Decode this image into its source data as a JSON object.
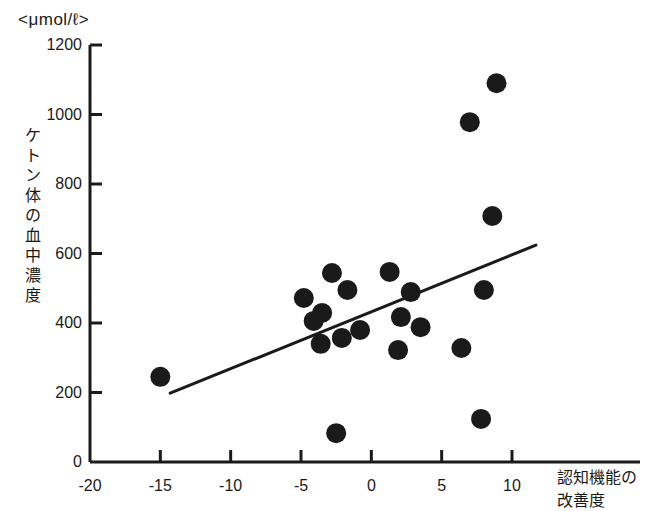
{
  "figure": {
    "unit_label": "<μmol/ℓ>",
    "y_axis_title": "ケトン体の血中濃度",
    "x_axis_title_line1": "認知機能の",
    "x_axis_title_line2": "改善度",
    "marker_color": "#1a1a1a",
    "axis_color": "#1a1a1a",
    "trendline_color": "#1a1a1a",
    "background_color": "#ffffff"
  },
  "chart_data": {
    "type": "scatter",
    "title": "",
    "subtitle": "",
    "xlabel": "認知機能の改善度",
    "ylabel": "ケトン体の血中濃度",
    "unit": "μmol/ℓ",
    "xlim": [
      -20,
      10
    ],
    "ylim": [
      0,
      1200
    ],
    "xticks": [
      -20,
      -15,
      -10,
      -5,
      0,
      5,
      10
    ],
    "xtick_labels": [
      "-20",
      "-15",
      "-10",
      "-5",
      "0",
      "5",
      "10"
    ],
    "yticks": [
      0,
      200,
      400,
      600,
      800,
      1000,
      1200
    ],
    "ytick_labels": [
      "0",
      "200",
      "400",
      "600",
      "800",
      "1000",
      "1200"
    ],
    "grid": false,
    "legend": false,
    "marker_size_px": 20,
    "series": [
      {
        "name": "被検者",
        "points": [
          {
            "x": -15.0,
            "y": 245
          },
          {
            "x": -4.8,
            "y": 472
          },
          {
            "x": -4.1,
            "y": 406
          },
          {
            "x": -3.5,
            "y": 429
          },
          {
            "x": -2.8,
            "y": 544
          },
          {
            "x": -1.7,
            "y": 495
          },
          {
            "x": -3.6,
            "y": 340
          },
          {
            "x": -2.1,
            "y": 357
          },
          {
            "x": -0.8,
            "y": 380
          },
          {
            "x": 1.3,
            "y": 547
          },
          {
            "x": 2.8,
            "y": 489
          },
          {
            "x": 2.1,
            "y": 417
          },
          {
            "x": 3.5,
            "y": 388
          },
          {
            "x": 1.9,
            "y": 322
          },
          {
            "x": 6.4,
            "y": 328
          },
          {
            "x": 8.0,
            "y": 495
          },
          {
            "x": 8.6,
            "y": 708
          },
          {
            "x": 7.0,
            "y": 978
          },
          {
            "x": 8.9,
            "y": 1090
          },
          {
            "x": -2.5,
            "y": 83
          },
          {
            "x": 7.8,
            "y": 124
          }
        ]
      }
    ],
    "trendline": {
      "type": "linear",
      "x_start": -14.3,
      "y_start": 198,
      "x_end": 11.7,
      "y_end": 624
    }
  }
}
